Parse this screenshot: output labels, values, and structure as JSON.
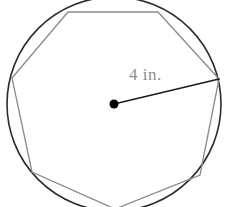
{
  "figure": {
    "width": 233,
    "height": 207,
    "background_color": "#ffffff",
    "circle": {
      "center_x": 114,
      "center_y": 104,
      "radius": 107,
      "stroke_color": "#2b2b2b",
      "stroke_width": 1.6,
      "fill": "none"
    },
    "polygon": {
      "name": "heptagon",
      "sides": 7,
      "stroke_color": "#8a8a8a",
      "stroke_width": 1.3,
      "fill": "none",
      "points": "68,12 158,12 219,79 200,175 115,209 32,172 12,78",
      "vertices": [
        {
          "x": 68,
          "y": 12
        },
        {
          "x": 158,
          "y": 12
        },
        {
          "x": 219,
          "y": 79
        },
        {
          "x": 200,
          "y": 175
        },
        {
          "x": 115,
          "y": 209
        },
        {
          "x": 32,
          "y": 172
        },
        {
          "x": 12,
          "y": 78
        }
      ]
    },
    "center_point": {
      "x": 114,
      "y": 104,
      "dot_radius": 4.5,
      "color": "#000000"
    },
    "radius_line": {
      "x1": 114,
      "y1": 104,
      "x2": 219,
      "y2": 79,
      "stroke_color": "#1a1a1a",
      "stroke_width": 1.5
    },
    "radius_label": {
      "text": "4 in.",
      "x": 129,
      "y": 80,
      "color": "#8d8d8d",
      "font_size": 17
    }
  }
}
